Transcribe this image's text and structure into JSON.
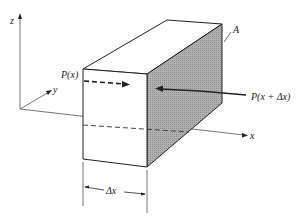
{
  "diagram": {
    "axes": {
      "z_label": "z",
      "y_label": "y",
      "x_label": "x"
    },
    "labels": {
      "area": "A",
      "pressure_in": "P(x)",
      "pressure_out": "P(x + Δx)",
      "length": "Δx"
    },
    "colors": {
      "line": "#222222",
      "shaded_face": "#a9a9a9",
      "axis": "#666666"
    }
  }
}
